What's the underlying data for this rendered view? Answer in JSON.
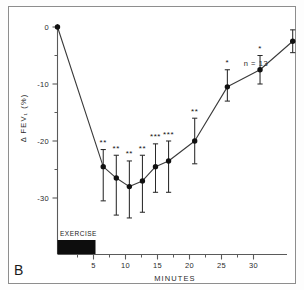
{
  "figure": {
    "panel_label": "B",
    "annotation": "n = 13",
    "exercise_label": "EXERCISE"
  },
  "chart_data": {
    "type": "line",
    "title": "",
    "subtitle": "",
    "xlabel": "MINUTES",
    "ylabel": "Δ FEV₁ (%)",
    "xlim": [
      0,
      40
    ],
    "ylim": [
      -35,
      2
    ],
    "grid": false,
    "legend": "none",
    "x_ticks": [
      5,
      10,
      15,
      20,
      25,
      30,
      35,
      40
    ],
    "x_tick_labels": [
      "5",
      "10",
      "15",
      "20",
      "25",
      "30",
      "35",
      "40"
    ],
    "x_minor_ticks": [
      2.5,
      7.5,
      12.5,
      17.5,
      22.5,
      27.5,
      32.5,
      37.5
    ],
    "y_ticks": [
      0,
      -10,
      -20,
      -30
    ],
    "y_tick_labels": [
      "0",
      "-10",
      "-20",
      "-30"
    ],
    "y_minor_ticks": [
      -5,
      -15,
      -25
    ],
    "series": [
      {
        "name": "Δ FEV₁ (%)",
        "x": [
          0,
          7,
          9,
          11,
          13,
          15,
          17,
          21,
          26,
          31,
          36
        ],
        "values": [
          0,
          -24.5,
          -26.5,
          -28.0,
          -27.0,
          -24.5,
          -23.5,
          -20.0,
          -10.5,
          -7.5,
          -2.5
        ],
        "error_upper": [
          0,
          3.0,
          4.0,
          4.5,
          4.5,
          4.0,
          3.5,
          4.0,
          3.0,
          2.5,
          2.0
        ],
        "error_lower": [
          0,
          6.0,
          6.5,
          5.5,
          5.5,
          4.5,
          5.5,
          4.0,
          2.5,
          2.5,
          2.0
        ],
        "significance": [
          "",
          "**",
          "**",
          "**",
          "**",
          "***",
          "***",
          "**",
          "*",
          "*",
          ""
        ]
      }
    ],
    "exercise_bar": {
      "start": 0,
      "end": 6,
      "label": "EXERCISE",
      "color": "#0d0d0d"
    },
    "annotations": [
      {
        "text": "n = 13",
        "x": 34,
        "y": -5.5
      }
    ]
  },
  "colors": {
    "axis": "#5a5a5a",
    "line": "#3a3a3a",
    "marker": "#111111",
    "text": "#2b2b2b",
    "exercise_bar": "#0d0d0d",
    "background": "#ffffff"
  }
}
